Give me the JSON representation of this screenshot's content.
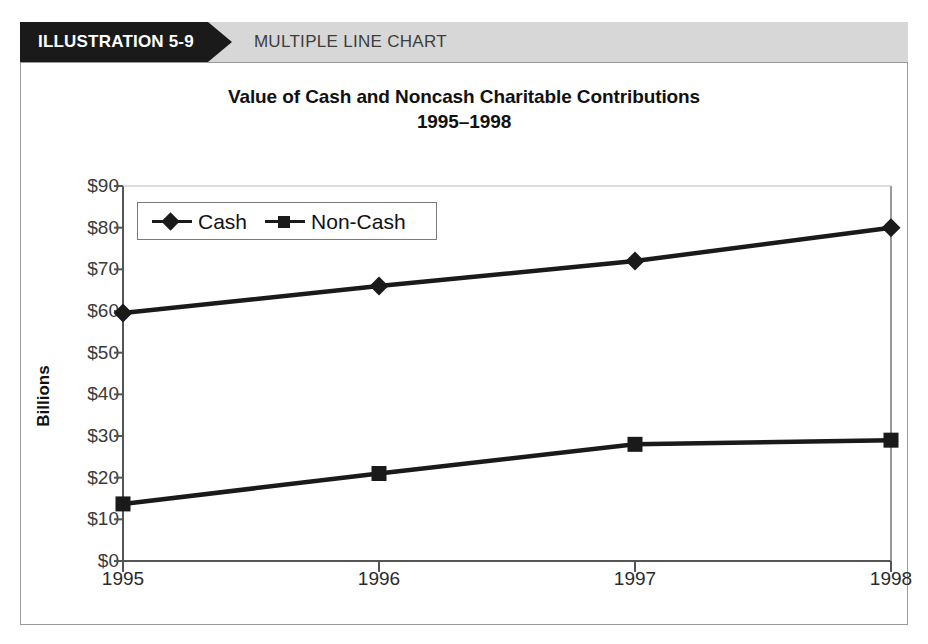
{
  "banner": {
    "tab_label": "ILLUSTRATION 5-9",
    "subtitle": "MULTIPLE LINE CHART",
    "tab_color": "#1a1a1a",
    "band_color": "#d7d7d7"
  },
  "chart_data": {
    "type": "line",
    "title": "Value of Cash and Noncash Charitable Contributions",
    "subtitle": "1995–1998",
    "xlabel": "",
    "ylabel": "Billions",
    "categories": [
      "1995",
      "1996",
      "1997",
      "1998"
    ],
    "ylim": [
      0,
      90
    ],
    "yticks": [
      "$0",
      "$10",
      "$20",
      "$30",
      "$40",
      "$50",
      "$60",
      "$70",
      "$80",
      "$90"
    ],
    "ytick_values": [
      0,
      10,
      20,
      30,
      40,
      50,
      60,
      70,
      80,
      90
    ],
    "grid": false,
    "legend_position": "upper-left-inside",
    "series": [
      {
        "name": "Cash",
        "marker": "diamond",
        "color": "#1a1a1a",
        "values": [
          59.5,
          66,
          72,
          80
        ]
      },
      {
        "name": "Non-Cash",
        "marker": "square",
        "color": "#1a1a1a",
        "values": [
          13.7,
          21,
          28,
          29
        ]
      }
    ]
  }
}
